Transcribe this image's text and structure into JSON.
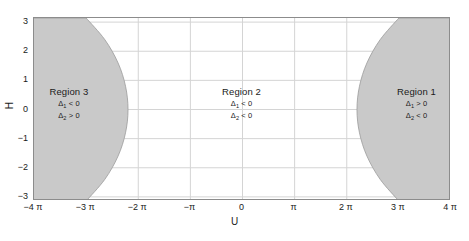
{
  "chart_data": {
    "type": "area",
    "title": "",
    "xlabel": "U",
    "ylabel": "H",
    "xlim": [
      -12.566370614359172,
      12.566370614359172
    ],
    "ylim": [
      -3.141592653589793,
      3.141592653589793
    ],
    "grid": true,
    "legend": "none",
    "xticks": [
      {
        "value": -12.566370614359172,
        "label": "−4 π"
      },
      {
        "value": -9.42477796076938,
        "label": "−3 π"
      },
      {
        "value": -6.283185307179586,
        "label": "−2 π"
      },
      {
        "value": -3.141592653589793,
        "label": "−π"
      },
      {
        "value": 0,
        "label": "0"
      },
      {
        "value": 3.141592653589793,
        "label": "π"
      },
      {
        "value": 6.283185307179586,
        "label": "2 π"
      },
      {
        "value": 9.42477796076938,
        "label": "3 π"
      },
      {
        "value": 12.566370614359172,
        "label": "4 π"
      }
    ],
    "yticks": [
      {
        "value": 3,
        "label": "3"
      },
      {
        "value": 2,
        "label": "2"
      },
      {
        "value": 1,
        "label": "1"
      },
      {
        "value": 0,
        "label": "0"
      },
      {
        "value": -1,
        "label": "−1"
      },
      {
        "value": -2,
        "label": "−2"
      },
      {
        "value": -3,
        "label": "−3"
      }
    ],
    "shaded_color": "#c9c9c9",
    "background_color": "#ffffff",
    "grid_color": "#d4d4d4",
    "frame_color": "#8c8c8c",
    "shaded_regions": [
      {
        "name": "left-shaded-region",
        "description": "Region 3 shaded area spanning left edge to a rightward-bulging boundary curve",
        "boundary_points": [
          {
            "u": -9.42477796076938,
            "h": 3.141592653589793
          },
          {
            "u": -8.3,
            "h": 2.4
          },
          {
            "u": -7.5,
            "h": 1.6
          },
          {
            "u": -7.05,
            "h": 0.8
          },
          {
            "u": -6.9,
            "h": 0.0
          },
          {
            "u": -7.05,
            "h": -0.8
          },
          {
            "u": -7.5,
            "h": -1.6
          },
          {
            "u": -8.3,
            "h": -2.4
          },
          {
            "u": -9.42477796076938,
            "h": -3.141592653589793
          }
        ]
      },
      {
        "name": "right-shaded-region",
        "description": "Region 1 shaded area spanning a leftward-bulging boundary curve to the right edge",
        "boundary_points": [
          {
            "u": 9.42477796076938,
            "h": 3.141592653589793
          },
          {
            "u": 8.3,
            "h": 2.4
          },
          {
            "u": 7.5,
            "h": 1.6
          },
          {
            "u": 7.05,
            "h": 0.8
          },
          {
            "u": 6.9,
            "h": 0.0
          },
          {
            "u": 7.05,
            "h": -0.8
          },
          {
            "u": 7.5,
            "h": -1.6
          },
          {
            "u": 8.3,
            "h": -2.4
          },
          {
            "u": 9.42477796076938,
            "h": -3.141592653589793
          }
        ]
      }
    ],
    "annotations": [
      {
        "id": "region-3",
        "title": "Region 3",
        "conditions": [
          {
            "symbol": "Δ",
            "subscript": "1",
            "relation": "< 0"
          },
          {
            "symbol": "Δ",
            "subscript": "2",
            "relation": "> 0"
          }
        ],
        "u": -10.4,
        "h": 0.55
      },
      {
        "id": "region-2",
        "title": "Region 2",
        "conditions": [
          {
            "symbol": "Δ",
            "subscript": "1",
            "relation": "< 0"
          },
          {
            "symbol": "Δ",
            "subscript": "2",
            "relation": "< 0"
          }
        ],
        "u": 0.0,
        "h": 0.55
      },
      {
        "id": "region-1",
        "title": "Region 1",
        "conditions": [
          {
            "symbol": "Δ",
            "subscript": "1",
            "relation": "> 0"
          },
          {
            "symbol": "Δ",
            "subscript": "2",
            "relation": "< 0"
          }
        ],
        "u": 10.55,
        "h": 0.55
      }
    ]
  }
}
